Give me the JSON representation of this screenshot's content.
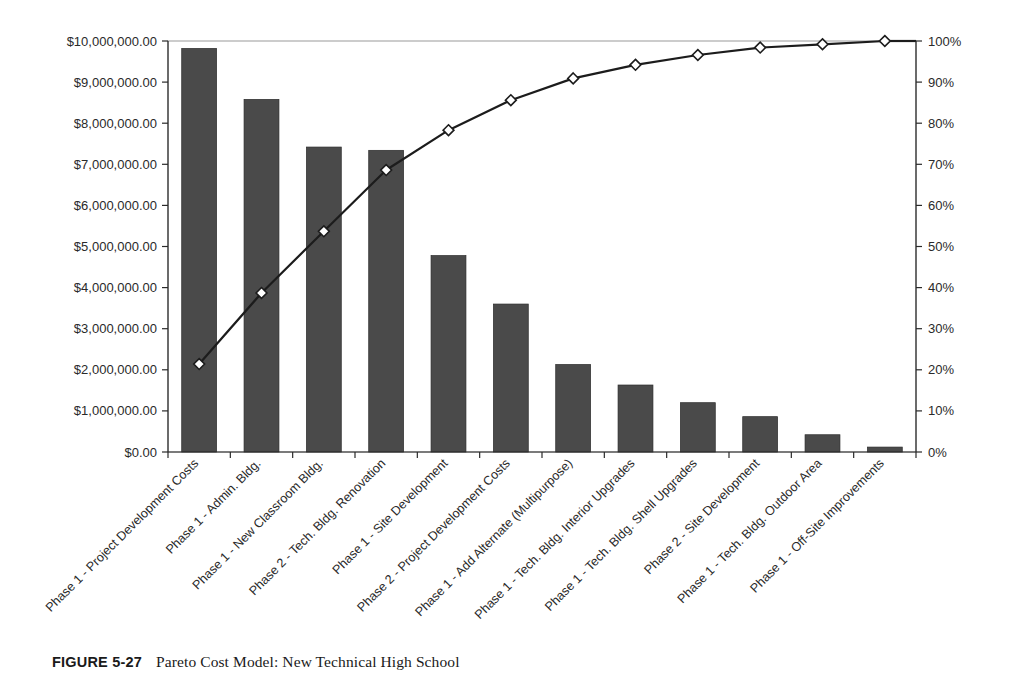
{
  "figure": {
    "label": "FIGURE 5-27",
    "caption": "Pareto Cost Model: New Technical High School"
  },
  "colors": {
    "bar_fill": "#4a4a4a",
    "bar_stroke": "#2d2d2d",
    "line_stroke": "#1c1c1c",
    "marker_fill": "#ffffff",
    "axis": "#2a2a2a",
    "plot_border": "#9a9a9a",
    "background": "#ffffff"
  },
  "chart_data": {
    "type": "bar",
    "title": "",
    "subtitle": "",
    "xlabel": "",
    "ylabel": "",
    "y2label": "",
    "grid": false,
    "legend": "none",
    "categories": [
      "Phase 1 - Project Development Costs",
      "Phase 1 - Admin. Bldg.",
      "Phase 1 - New Classroom Bldg.",
      "Phase 2 - Tech. Bldg. Renovation",
      "Phase 1 - Site Development",
      "Phase 2 - Project Development Costs",
      "Phase 1 - Add Alternate (Multipurpose)",
      "Phase 1 - Tech. Bldg. Interior Upgrades",
      "Phase 1 - Tech. Bldg. Shell Upgrades",
      "Phase 2 - Site Development",
      "Phase 1 - Tech. Bldg. Outdoor Area",
      "Phase 1 - Off-Site Improvements"
    ],
    "series": [
      {
        "name": "Cost",
        "type": "bar",
        "axis": "left",
        "values": [
          9820000,
          8580000,
          7420000,
          7340000,
          4780000,
          3600000,
          2130000,
          1630000,
          1200000,
          860000,
          420000,
          120000
        ]
      },
      {
        "name": "Cumulative Percent",
        "type": "line",
        "axis": "right",
        "values": [
          21.4,
          38.7,
          53.7,
          68.6,
          78.3,
          85.6,
          90.9,
          94.2,
          96.6,
          98.4,
          99.2,
          100.0
        ]
      }
    ],
    "ylim": [
      0,
      10000000
    ],
    "y2lim": [
      0,
      100
    ],
    "y_ticks": [
      0,
      1000000,
      2000000,
      3000000,
      4000000,
      5000000,
      6000000,
      7000000,
      8000000,
      9000000,
      10000000
    ],
    "y_tick_labels": [
      "$0.00",
      "$1,000,000.00",
      "$2,000,000.00",
      "$3,000,000.00",
      "$4,000,000.00",
      "$5,000,000.00",
      "$6,000,000.00",
      "$7,000,000.00",
      "$8,000,000.00",
      "$9,000,000.00",
      "$10,000,000.00"
    ],
    "y2_ticks": [
      0,
      10,
      20,
      30,
      40,
      50,
      60,
      70,
      80,
      90,
      100
    ],
    "y2_tick_labels": [
      "0%",
      "10%",
      "20%",
      "30%",
      "40%",
      "50%",
      "60%",
      "70%",
      "80%",
      "90%",
      "100%"
    ]
  }
}
